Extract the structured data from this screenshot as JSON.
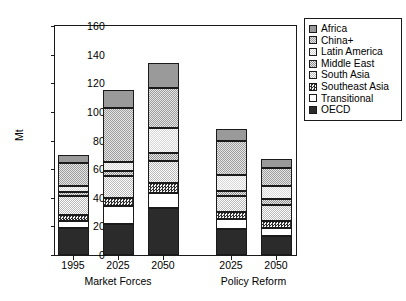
{
  "chart_data": {
    "type": "bar",
    "subtype": "stacked-bar",
    "title": "",
    "xlabel": "",
    "ylabel": "Mt",
    "ylim": [
      0,
      160
    ],
    "yticks": [
      0,
      20,
      40,
      60,
      80,
      100,
      120,
      140,
      160
    ],
    "grid": false,
    "legend_position": "right",
    "categories": [
      "1995",
      "2025",
      "2050",
      "2025",
      "2050"
    ],
    "groups": [
      {
        "label": "Market Forces",
        "categories": [
          "1995",
          "2025",
          "2050"
        ]
      },
      {
        "label": "Policy Reform",
        "categories": [
          "2025",
          "2050"
        ]
      }
    ],
    "series": [
      {
        "name": "OECD",
        "pattern": "solid-black",
        "color": "#2b2b2b",
        "values": [
          19,
          22,
          33,
          18,
          13
        ]
      },
      {
        "name": "Transitional",
        "pattern": "solid-white",
        "color": "#ffffff",
        "values": [
          5,
          12,
          10,
          7,
          6
        ]
      },
      {
        "name": "Southeast Asia",
        "pattern": "dense-checker",
        "color": "#4d4d4d",
        "values": [
          4,
          6,
          7,
          5,
          5
        ]
      },
      {
        "name": "South Asia",
        "pattern": "light-checker",
        "color": "#c9c9c9",
        "values": [
          13,
          15,
          16,
          11,
          11
        ]
      },
      {
        "name": "Middle East",
        "pattern": "mid-checker",
        "color": "#a8a8a8",
        "values": [
          3,
          4,
          5,
          4,
          4
        ]
      },
      {
        "name": "Latin America",
        "pattern": "pale-checker",
        "color": "#dedede",
        "values": [
          4,
          6,
          18,
          11,
          9
        ]
      },
      {
        "name": "China+",
        "pattern": "med-checker",
        "color": "#b5b5b5",
        "values": [
          16,
          38,
          28,
          24,
          13
        ]
      },
      {
        "name": "Africa",
        "pattern": "gray-solid",
        "color": "#9a9a9a",
        "values": [
          6,
          12,
          17,
          8,
          6
        ]
      }
    ],
    "totals": [
      70,
      115,
      134,
      88,
      67
    ],
    "legend_order": [
      "Africa",
      "China+",
      "Latin America",
      "Middle East",
      "South Asia",
      "Southeast Asia",
      "Transitional",
      "OECD"
    ],
    "units": "Mt"
  },
  "legend": {
    "items": [
      {
        "label": "Africa"
      },
      {
        "label": "China+"
      },
      {
        "label": "Latin America"
      },
      {
        "label": "Middle East"
      },
      {
        "label": "South Asia"
      },
      {
        "label": "Southeast Asia"
      },
      {
        "label": "Transitional"
      },
      {
        "label": "OECD"
      }
    ]
  }
}
